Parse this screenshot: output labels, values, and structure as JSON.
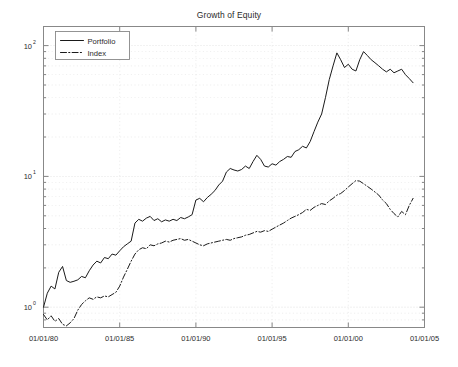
{
  "figure": {
    "title": "Growth of Equity",
    "background_color": "#ffffff",
    "axes_color": "#808080",
    "grid_color": "#cfcfcf",
    "series_color": "#1a1a1a"
  },
  "legend": {
    "position": "top-left",
    "entries": [
      {
        "label": "Portfolio",
        "style": "solid"
      },
      {
        "label": "Index",
        "style": "dash-dot"
      }
    ]
  },
  "axes": {
    "x": {
      "label": "",
      "tick_labels": [
        "01/01/80",
        "01/01/85",
        "01/01/90",
        "01/01/95",
        "01/01/00",
        "01/01/05"
      ],
      "range": [
        "01/01/80",
        "01/01/05"
      ],
      "scale": "date"
    },
    "y": {
      "label": "",
      "tick_labels": [
        "10^0",
        "10^1",
        "10^2"
      ],
      "tick_mantissas": [
        "10",
        "10",
        "10"
      ],
      "tick_exponents": [
        "0",
        "1",
        "2"
      ],
      "range": [
        0.7,
        140
      ],
      "scale": "log",
      "grid": "minor-dotted"
    }
  },
  "chart_data": {
    "type": "line",
    "title": "Growth of Equity",
    "xlabel": "",
    "ylabel": "",
    "xlim": [
      1980.0,
      2005.0
    ],
    "ylim": [
      0.7,
      140
    ],
    "yscale": "log",
    "grid": true,
    "legend_position": "top-left",
    "xticks": [
      1980,
      1985,
      1990,
      1995,
      2000,
      2005
    ],
    "xticklabels": [
      "01/01/80",
      "01/01/85",
      "01/01/90",
      "01/01/95",
      "01/01/00",
      "01/01/05"
    ],
    "yticks": [
      1,
      10,
      100
    ],
    "yticklabels": [
      "10^0",
      "10^1",
      "10^2"
    ],
    "series": [
      {
        "name": "Portfolio",
        "style": "solid",
        "color": "#1a1a1a",
        "x": [
          1980.0,
          1980.25,
          1980.5,
          1980.75,
          1981.0,
          1981.25,
          1981.5,
          1981.75,
          1982.0,
          1982.25,
          1982.5,
          1982.75,
          1983.0,
          1983.25,
          1983.5,
          1983.75,
          1984.0,
          1984.25,
          1984.5,
          1984.75,
          1985.0,
          1985.25,
          1985.5,
          1985.75,
          1986.0,
          1986.25,
          1986.5,
          1986.75,
          1987.0,
          1987.25,
          1987.5,
          1987.75,
          1988.0,
          1988.25,
          1988.5,
          1988.75,
          1989.0,
          1989.25,
          1989.5,
          1989.75,
          1990.0,
          1990.25,
          1990.5,
          1990.75,
          1991.0,
          1991.25,
          1991.5,
          1991.75,
          1992.0,
          1992.25,
          1992.5,
          1992.75,
          1993.0,
          1993.25,
          1993.5,
          1993.75,
          1994.0,
          1994.25,
          1994.5,
          1994.75,
          1995.0,
          1995.25,
          1995.5,
          1995.75,
          1996.0,
          1996.25,
          1996.5,
          1996.75,
          1997.0,
          1997.25,
          1997.5,
          1997.75,
          1998.0,
          1998.25,
          1998.5,
          1998.75,
          1999.0,
          1999.25,
          1999.5,
          1999.75,
          2000.0,
          2000.25,
          2000.5,
          2000.75,
          2001.0,
          2001.25,
          2001.5,
          2001.75,
          2002.0,
          2002.25,
          2002.5,
          2002.75,
          2003.0,
          2003.25,
          2003.5,
          2003.75,
          2004.0,
          2004.25
        ],
        "y": [
          1.0,
          1.28,
          1.45,
          1.38,
          1.85,
          2.05,
          1.6,
          1.55,
          1.58,
          1.62,
          1.72,
          1.68,
          1.9,
          2.1,
          2.25,
          2.18,
          2.4,
          2.35,
          2.55,
          2.5,
          2.7,
          2.9,
          3.05,
          3.2,
          4.4,
          4.7,
          4.55,
          4.8,
          4.95,
          4.6,
          4.75,
          4.5,
          4.65,
          4.55,
          4.7,
          4.6,
          4.85,
          4.75,
          4.9,
          5.1,
          6.6,
          6.8,
          6.4,
          6.9,
          7.3,
          7.8,
          8.6,
          9.2,
          10.8,
          11.5,
          11.2,
          11.0,
          11.3,
          12.0,
          11.5,
          13.0,
          14.5,
          13.5,
          12.0,
          11.8,
          12.5,
          12.2,
          13.0,
          13.5,
          14.2,
          14.0,
          15.5,
          16.0,
          17.0,
          16.5,
          18.5,
          22.0,
          26.0,
          30.0,
          40.0,
          55.0,
          70.0,
          88.0,
          78.0,
          68.0,
          72.0,
          66.0,
          64.0,
          78.0,
          90.0,
          84.0,
          78.0,
          74.0,
          70.0,
          66.0,
          63.0,
          66.0,
          62.0,
          64.0,
          66.0,
          60.0,
          56.0,
          52.0
        ]
      },
      {
        "name": "Index",
        "style": "dash-dot",
        "color": "#1a1a1a",
        "x": [
          1980.0,
          1980.25,
          1980.5,
          1980.75,
          1981.0,
          1981.25,
          1981.5,
          1981.75,
          1982.0,
          1982.25,
          1982.5,
          1982.75,
          1983.0,
          1983.25,
          1983.5,
          1983.75,
          1984.0,
          1984.25,
          1984.5,
          1984.75,
          1985.0,
          1985.25,
          1985.5,
          1985.75,
          1986.0,
          1986.25,
          1986.5,
          1986.75,
          1987.0,
          1987.25,
          1987.5,
          1987.75,
          1988.0,
          1988.25,
          1988.5,
          1988.75,
          1989.0,
          1989.25,
          1989.5,
          1989.75,
          1990.0,
          1990.25,
          1990.5,
          1990.75,
          1991.0,
          1991.25,
          1991.5,
          1991.75,
          1992.0,
          1992.25,
          1992.5,
          1992.75,
          1993.0,
          1993.25,
          1993.5,
          1993.75,
          1994.0,
          1994.25,
          1994.5,
          1994.75,
          1995.0,
          1995.25,
          1995.5,
          1995.75,
          1996.0,
          1996.25,
          1996.5,
          1996.75,
          1997.0,
          1997.25,
          1997.5,
          1997.75,
          1998.0,
          1998.25,
          1998.5,
          1998.75,
          1999.0,
          1999.25,
          1999.5,
          1999.75,
          2000.0,
          2000.25,
          2000.5,
          2000.75,
          2001.0,
          2001.25,
          2001.5,
          2001.75,
          2002.0,
          2002.25,
          2002.5,
          2002.75,
          2003.0,
          2003.25,
          2003.5,
          2003.75,
          2004.0,
          2004.25
        ],
        "y": [
          0.88,
          0.8,
          0.86,
          0.78,
          0.82,
          0.74,
          0.72,
          0.76,
          0.82,
          0.95,
          1.05,
          1.12,
          1.18,
          1.15,
          1.2,
          1.18,
          1.22,
          1.2,
          1.25,
          1.3,
          1.45,
          1.7,
          1.95,
          2.25,
          2.55,
          2.75,
          2.85,
          2.8,
          3.0,
          2.95,
          3.05,
          3.1,
          3.2,
          3.15,
          3.25,
          3.3,
          3.35,
          3.25,
          3.3,
          3.2,
          3.1,
          3.0,
          2.95,
          3.05,
          3.1,
          3.15,
          3.2,
          3.25,
          3.3,
          3.25,
          3.35,
          3.4,
          3.45,
          3.55,
          3.6,
          3.7,
          3.8,
          3.75,
          3.85,
          3.8,
          3.95,
          4.1,
          4.25,
          4.4,
          4.6,
          4.8,
          4.95,
          5.1,
          5.3,
          5.6,
          5.5,
          5.8,
          6.0,
          6.2,
          6.1,
          6.5,
          6.8,
          7.2,
          7.4,
          7.8,
          8.3,
          8.8,
          9.3,
          9.2,
          8.8,
          8.4,
          8.0,
          7.6,
          7.2,
          6.6,
          6.2,
          5.6,
          5.2,
          4.9,
          5.4,
          5.1,
          6.0,
          6.8
        ]
      }
    ]
  }
}
